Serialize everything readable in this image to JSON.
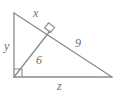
{
  "figure": {
    "type": "geometry-diagram",
    "shape": "right-triangle-with-altitude",
    "stroke_color": "#8a8a8a",
    "label_color": "#6f6f6f",
    "background_color": "#ffffff",
    "vertices": {
      "top": {
        "x": 14,
        "y": 13
      },
      "bottom_left": {
        "x": 14,
        "y": 77
      },
      "bottom_right": {
        "x": 112,
        "y": 77
      },
      "altitude_foot": {
        "x": 50,
        "y": 31
      }
    },
    "segments": [
      {
        "name": "hypotenuse-upper",
        "from": "top",
        "to": "altitude_foot",
        "label": "x"
      },
      {
        "name": "vertical-leg",
        "from": "top",
        "to": "bottom_left",
        "label": "y"
      },
      {
        "name": "altitude",
        "from": "bottom_left",
        "to": "altitude_foot",
        "label": "6"
      },
      {
        "name": "hypotenuse-lower",
        "from": "altitude_foot",
        "to": "bottom_right",
        "label": "9"
      },
      {
        "name": "horizontal-leg",
        "from": "bottom_left",
        "to": "bottom_right",
        "label": "z"
      }
    ],
    "right_angle_markers": [
      {
        "name": "right-angle-bottom-left",
        "at": "bottom_left"
      },
      {
        "name": "right-angle-altitude-foot",
        "at": "altitude_foot"
      }
    ],
    "labels": {
      "x": "x",
      "y": "y",
      "altitude": "6",
      "hypotenuse_lower": "9",
      "z": "z"
    }
  }
}
